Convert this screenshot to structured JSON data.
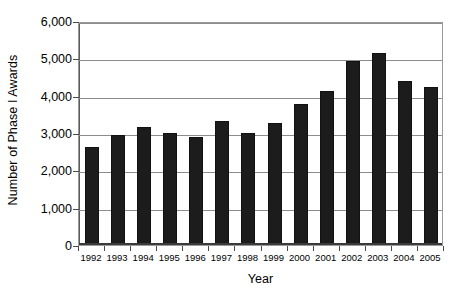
{
  "chart_data": {
    "type": "bar",
    "title": "",
    "xlabel": "Year",
    "ylabel": "Number of Phase I Awards",
    "categories": [
      "1992",
      "1993",
      "1994",
      "1995",
      "1996",
      "1997",
      "1998",
      "1999",
      "2000",
      "2001",
      "2002",
      "2003",
      "2004",
      "2005"
    ],
    "values": [
      2620,
      2950,
      3150,
      3000,
      2880,
      3320,
      3000,
      3270,
      3780,
      4120,
      4930,
      5150,
      4400,
      4220
    ],
    "ylim": [
      0,
      6000
    ],
    "ytick_values": [
      0,
      1000,
      2000,
      3000,
      4000,
      5000,
      6000
    ],
    "ytick_labels": [
      "0",
      "1,000",
      "2,000",
      "3,000",
      "4,000",
      "5,000",
      "6,000"
    ],
    "grid": true,
    "legend": "none",
    "bar_color": "#1c1c1c",
    "gridline_color": "#8c8c8c",
    "background_color": "#ffffff"
  }
}
